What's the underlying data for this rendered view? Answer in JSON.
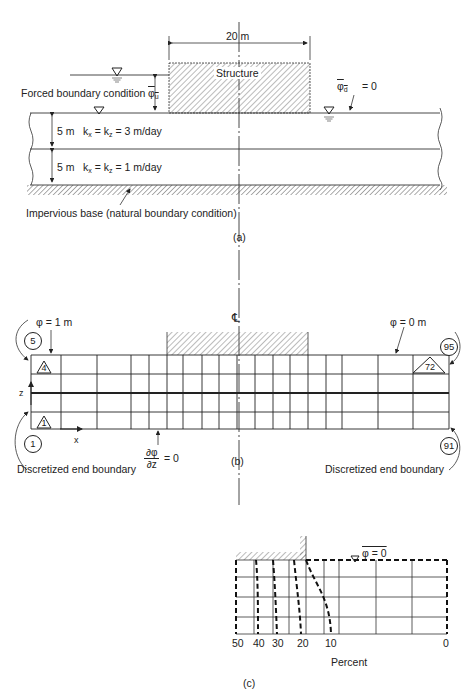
{
  "panel_a": {
    "caption": "(a)",
    "width_dim": "20 m",
    "structure_label": "Structure",
    "upstream_label": "Forced boundary condition",
    "upstream_symbol": "φ",
    "upstream_sub": "u",
    "downstream_symbol": "φ",
    "downstream_sub": "d",
    "downstream_eq": "= 0",
    "layer1_thickness": "5 m",
    "layer1_k": "k",
    "layer1_kx": "x",
    "layer1_kz": "z",
    "layer1_value": "= 3 m/day",
    "layer2_thickness": "5 m",
    "layer2_value": "= 1 m/day",
    "base_label": "Impervious base (natural boundary condition)"
  },
  "panel_b": {
    "caption": "(b)",
    "centerline_symbol": "℄",
    "left_head": "φ = 1 m",
    "right_head": "φ = 0 m",
    "node_top_left": "5",
    "node_bottom_left": "1",
    "node_top_right": "95",
    "node_bottom_right": "91",
    "element_top_left": "4",
    "element_bottom_left": "1",
    "element_top_right": "72",
    "axis_z": "z",
    "axis_x": "x",
    "flux_num": "∂φ",
    "flux_den": "∂z",
    "flux_eq": "= 0",
    "left_end_label": "Discretized end boundary",
    "right_end_label": "Discretized end boundary",
    "grid_columns_x": [
      31,
      61,
      97,
      131,
      149,
      167,
      183,
      202,
      219,
      237,
      255,
      273,
      290,
      308,
      326,
      342,
      378,
      413,
      449
    ],
    "grid_rows_y": [
      355,
      374,
      393,
      412,
      429
    ]
  },
  "panel_c": {
    "caption": "(c)",
    "surface_label": "φ = 0",
    "axis_title": "Percent",
    "ticks": [
      "50",
      "40",
      "30",
      "20",
      "10",
      "0"
    ],
    "contour_values": [
      40,
      30,
      20,
      10
    ]
  }
}
